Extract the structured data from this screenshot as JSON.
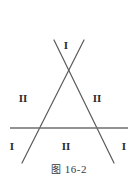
{
  "figure": {
    "caption_cjk": "图",
    "caption_number": "16-2",
    "caption_full": "图 16-2",
    "background_color": "#ffffff",
    "line_color": "#5a5a5a",
    "label_color": "#2b2b2b"
  },
  "labels": [
    {
      "id": "top",
      "text": "I",
      "x": 66,
      "y": 45
    },
    {
      "id": "middle-left",
      "text": "II",
      "x": 23,
      "y": 98
    },
    {
      "id": "middle-right",
      "text": "II",
      "x": 97,
      "y": 98
    },
    {
      "id": "bottom-left",
      "text": "I",
      "x": 12,
      "y": 146
    },
    {
      "id": "bottom-mid",
      "text": "II",
      "x": 66,
      "y": 146
    },
    {
      "id": "bottom-right",
      "text": "I",
      "x": 124,
      "y": 146
    }
  ],
  "geometry": {
    "type": "line-diagram",
    "lines": [
      {
        "name": "horizontal-line",
        "x1": 10,
        "y1": 128,
        "x2": 128,
        "y2": 128,
        "stroke": "#6e6e6e",
        "stroke_width": 1.4
      },
      {
        "name": "diagonal-line-down-left",
        "x1": 84,
        "y1": 40,
        "x2": 22,
        "y2": 163,
        "stroke": "#5a5a5a",
        "stroke_width": 1.2
      },
      {
        "name": "diagonal-line-down-right",
        "x1": 54,
        "y1": 40,
        "x2": 114,
        "y2": 163,
        "stroke": "#5a5a5a",
        "stroke_width": 1.2
      }
    ],
    "intersections": [
      {
        "name": "apex-crossing",
        "x": 69,
        "y": 72
      },
      {
        "name": "left-base-crossing",
        "x": 39,
        "y": 128
      },
      {
        "name": "right-base-crossing",
        "x": 98,
        "y": 128
      }
    ]
  }
}
